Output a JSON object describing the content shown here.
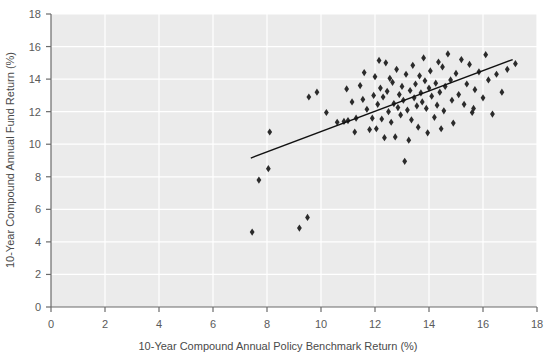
{
  "chart_data": {
    "type": "scatter",
    "title": "",
    "xlabel": "10-Year Compound Annual Policy Benchmark Return (%)",
    "ylabel": "10-Year Compound Annual Fund Return (%)",
    "xlim": [
      0,
      18
    ],
    "ylim": [
      0,
      18
    ],
    "xticks": [
      0,
      2,
      4,
      6,
      8,
      10,
      12,
      14,
      16,
      18
    ],
    "yticks": [
      0,
      2,
      4,
      6,
      8,
      10,
      12,
      14,
      16,
      18
    ],
    "grid": true,
    "grid_color": "#ffffff",
    "plot_background": "#ebebeb",
    "page_background": "#ffffff",
    "marker": "diamond",
    "marker_color": "#2b2b2b",
    "marker_size": 6,
    "legend": "none",
    "trendline": {
      "visible": true,
      "color": "#111111",
      "width": 1.4,
      "x0": 7.4,
      "y0": 9.15,
      "x1": 17.1,
      "y1": 15.2
    },
    "points": [
      [
        7.45,
        4.6
      ],
      [
        9.2,
        4.85
      ],
      [
        9.5,
        5.5
      ],
      [
        7.7,
        7.8
      ],
      [
        8.05,
        8.5
      ],
      [
        8.1,
        10.75
      ],
      [
        9.55,
        12.9
      ],
      [
        9.85,
        13.2
      ],
      [
        10.2,
        11.95
      ],
      [
        10.6,
        11.35
      ],
      [
        10.85,
        11.4
      ],
      [
        11.0,
        11.45
      ],
      [
        11.15,
        12.6
      ],
      [
        11.3,
        11.6
      ],
      [
        11.45,
        13.6
      ],
      [
        11.55,
        12.75
      ],
      [
        11.6,
        14.4
      ],
      [
        11.7,
        12.15
      ],
      [
        11.8,
        10.9
      ],
      [
        11.9,
        11.6
      ],
      [
        11.95,
        13.0
      ],
      [
        12.0,
        14.15
      ],
      [
        12.1,
        12.45
      ],
      [
        12.2,
        13.45
      ],
      [
        12.25,
        11.55
      ],
      [
        12.3,
        12.9
      ],
      [
        12.4,
        15.0
      ],
      [
        12.45,
        13.25
      ],
      [
        12.5,
        12.0
      ],
      [
        12.55,
        14.05
      ],
      [
        12.6,
        11.35
      ],
      [
        12.65,
        13.8
      ],
      [
        12.7,
        12.5
      ],
      [
        12.75,
        10.45
      ],
      [
        12.8,
        14.6
      ],
      [
        12.85,
        12.25
      ],
      [
        12.9,
        13.05
      ],
      [
        12.95,
        11.8
      ],
      [
        13.0,
        13.55
      ],
      [
        13.05,
        12.7
      ],
      [
        13.1,
        8.95
      ],
      [
        13.15,
        14.3
      ],
      [
        13.2,
        12.1
      ],
      [
        13.3,
        13.3
      ],
      [
        13.35,
        11.5
      ],
      [
        13.4,
        14.85
      ],
      [
        13.45,
        12.85
      ],
      [
        13.5,
        13.7
      ],
      [
        13.55,
        12.35
      ],
      [
        13.6,
        11.05
      ],
      [
        13.65,
        14.2
      ],
      [
        13.7,
        13.15
      ],
      [
        13.75,
        12.6
      ],
      [
        13.8,
        15.3
      ],
      [
        13.85,
        13.9
      ],
      [
        13.9,
        12.2
      ],
      [
        13.95,
        10.7
      ],
      [
        14.0,
        13.45
      ],
      [
        14.05,
        14.5
      ],
      [
        14.1,
        12.95
      ],
      [
        14.2,
        11.65
      ],
      [
        14.25,
        13.75
      ],
      [
        14.3,
        12.4
      ],
      [
        14.35,
        15.05
      ],
      [
        14.4,
        13.2
      ],
      [
        14.5,
        14.75
      ],
      [
        14.55,
        12.05
      ],
      [
        14.6,
        13.55
      ],
      [
        14.7,
        15.55
      ],
      [
        14.8,
        13.95
      ],
      [
        14.85,
        12.7
      ],
      [
        14.9,
        11.3
      ],
      [
        15.0,
        14.35
      ],
      [
        15.1,
        13.05
      ],
      [
        15.2,
        15.2
      ],
      [
        15.3,
        12.45
      ],
      [
        15.4,
        13.7
      ],
      [
        15.5,
        14.9
      ],
      [
        15.6,
        11.95
      ],
      [
        15.7,
        13.35
      ],
      [
        15.85,
        14.45
      ],
      [
        16.0,
        12.85
      ],
      [
        16.1,
        15.5
      ],
      [
        16.2,
        13.95
      ],
      [
        16.35,
        11.85
      ],
      [
        16.5,
        14.3
      ],
      [
        16.7,
        13.2
      ],
      [
        16.9,
        14.6
      ],
      [
        17.2,
        14.95
      ],
      [
        12.35,
        10.4
      ],
      [
        12.05,
        10.95
      ],
      [
        11.25,
        10.75
      ],
      [
        14.45,
        10.95
      ],
      [
        13.25,
        10.25
      ],
      [
        15.65,
        12.2
      ],
      [
        10.95,
        13.4
      ],
      [
        12.15,
        15.15
      ]
    ]
  }
}
